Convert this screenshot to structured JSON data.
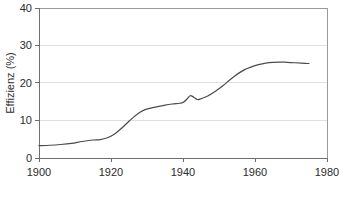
{
  "chart_data": {
    "type": "line",
    "title": "",
    "subtitle": "",
    "xlabel": "",
    "ylabel": "Effizienz (%)",
    "xlim": [
      1900,
      1980
    ],
    "ylim": [
      0,
      40
    ],
    "xticks": [
      1900,
      1920,
      1940,
      1960,
      1980
    ],
    "xtick_labels": [
      "1900",
      "1920",
      "1940",
      "1960",
      "1980"
    ],
    "yticks": [
      0,
      10,
      20,
      30,
      40
    ],
    "ytick_labels": [
      "0",
      "10",
      "20",
      "30",
      "40"
    ],
    "grid": "horizontal",
    "gridlines_y": [
      10,
      20,
      30
    ],
    "legend": null,
    "legend_position": "none",
    "annotations": [],
    "series": [
      {
        "name": "Effizienz",
        "color": "#4c4c4c",
        "x": [
          1900,
          1903,
          1906,
          1909,
          1912,
          1915,
          1917,
          1919,
          1921,
          1923,
          1925,
          1927,
          1929,
          1931,
          1933,
          1935,
          1937,
          1939,
          1940,
          1941,
          1942,
          1943,
          1944,
          1945,
          1947,
          1949,
          1951,
          1953,
          1955,
          1957,
          1959,
          1961,
          1963,
          1965,
          1967,
          1969,
          1971,
          1973,
          1975
        ],
        "y": [
          3.3,
          3.4,
          3.6,
          3.9,
          4.4,
          4.8,
          4.9,
          5.4,
          6.4,
          8.0,
          9.8,
          11.5,
          12.7,
          13.3,
          13.7,
          14.1,
          14.4,
          14.6,
          14.8,
          15.6,
          16.6,
          16.2,
          15.6,
          15.8,
          16.6,
          17.8,
          19.2,
          20.8,
          22.3,
          23.5,
          24.3,
          24.9,
          25.3,
          25.5,
          25.6,
          25.5,
          25.4,
          25.3,
          25.2
        ]
      }
    ],
    "ylabel_ticks_units": "%"
  },
  "axes": {
    "y_axis_title": "Effizienz (%)"
  },
  "colors": {
    "series_line": "#4c4c4c",
    "gridline": "#d8d8d8",
    "axis": "#6f6f6f",
    "frame": "#9a9a9a",
    "text": "#2b2b2b",
    "background": "#ffffff"
  }
}
